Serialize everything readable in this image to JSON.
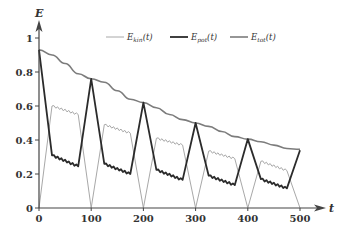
{
  "chart_data": {
    "type": "line",
    "title": "",
    "xlabel": "t",
    "ylabel": "E",
    "xlim": [
      0,
      500
    ],
    "ylim": [
      0,
      1.05
    ],
    "grid": false,
    "legend_position": "top",
    "x_ticks": [
      "0",
      "100",
      "200",
      "300",
      "400",
      "500"
    ],
    "y_ticks": [
      "0",
      "0.2",
      "0.4",
      "0.6",
      "0.8",
      "1"
    ],
    "legend": [
      {
        "name": "E_kin(t)",
        "main": "E",
        "sub": "kin",
        "suffix": "(t)",
        "color": "#a8a8a8",
        "width": 1
      },
      {
        "name": "E_pot(t)",
        "main": "E",
        "sub": "pot",
        "suffix": "(t)",
        "color": "#2b2b2b",
        "width": 1.8
      },
      {
        "name": "E_tot(t)",
        "main": "E",
        "sub": "tot",
        "suffix": "(t)",
        "color": "#7c7c7c",
        "width": 1.6
      }
    ],
    "series": [
      {
        "name": "E_kin(t)",
        "x": [
          0,
          25,
          75,
          100,
          125,
          175,
          200,
          225,
          275,
          300,
          325,
          375,
          400,
          425,
          475,
          500
        ],
        "values": [
          0,
          0.6,
          0.55,
          0,
          0.49,
          0.44,
          0,
          0.41,
          0.37,
          0,
          0.335,
          0.29,
          0,
          0.275,
          0.22,
          0
        ]
      },
      {
        "name": "E_pot(t)",
        "x": [
          0,
          25,
          75,
          100,
          125,
          175,
          200,
          225,
          275,
          300,
          325,
          375,
          400,
          425,
          475,
          500
        ],
        "values": [
          0.93,
          0.31,
          0.245,
          0.76,
          0.26,
          0.2,
          0.62,
          0.225,
          0.165,
          0.5,
          0.19,
          0.135,
          0.405,
          0.17,
          0.115,
          0.34
        ]
      },
      {
        "name": "E_tot(t)",
        "x": [
          0,
          25,
          50,
          75,
          100,
          125,
          150,
          175,
          200,
          225,
          250,
          275,
          300,
          325,
          350,
          375,
          400,
          425,
          450,
          475,
          500
        ],
        "values": [
          0.93,
          0.9,
          0.85,
          0.79,
          0.76,
          0.74,
          0.69,
          0.64,
          0.62,
          0.59,
          0.55,
          0.52,
          0.5,
          0.48,
          0.45,
          0.42,
          0.405,
          0.39,
          0.37,
          0.35,
          0.345
        ]
      }
    ]
  }
}
